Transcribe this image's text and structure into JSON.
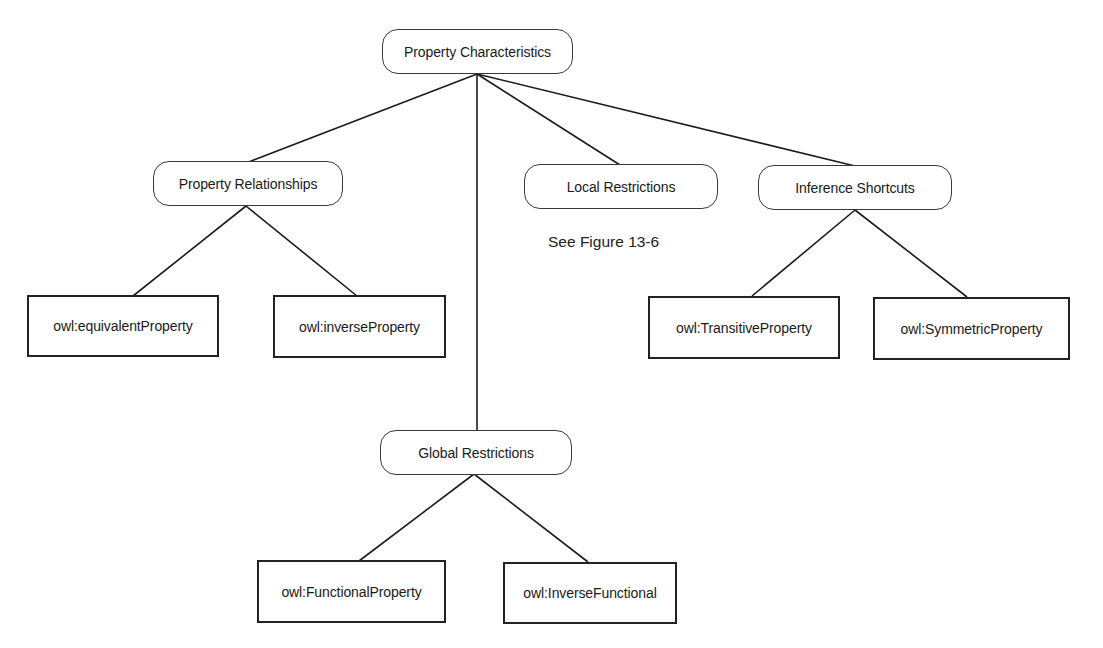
{
  "diagram": {
    "type": "tree",
    "root": {
      "id": "property-characteristics",
      "label": "Property Characteristics",
      "shape": "rounded"
    },
    "categories": [
      {
        "id": "property-relationships",
        "label": "Property Relationships",
        "shape": "rounded",
        "children": [
          {
            "id": "equivalent-property",
            "label": "owl:equivalentProperty",
            "shape": "rect"
          },
          {
            "id": "inverse-property",
            "label": "owl:inverseProperty",
            "shape": "rect"
          }
        ]
      },
      {
        "id": "global-restrictions",
        "label": "Global Restrictions",
        "shape": "rounded",
        "children": [
          {
            "id": "functional-property",
            "label": "owl:FunctionalProperty",
            "shape": "rect"
          },
          {
            "id": "inverse-functional",
            "label": "owl:InverseFunctional",
            "shape": "rect"
          }
        ]
      },
      {
        "id": "local-restrictions",
        "label": "Local Restrictions",
        "shape": "rounded",
        "note": "See Figure 13-6",
        "children": []
      },
      {
        "id": "inference-shortcuts",
        "label": "Inference Shortcuts",
        "shape": "rounded",
        "children": [
          {
            "id": "transitive-property",
            "label": "owl:TransitiveProperty",
            "shape": "rect"
          },
          {
            "id": "symmetric-property",
            "label": "owl:SymmetricProperty",
            "shape": "rect"
          }
        ]
      }
    ],
    "edges": [
      [
        "property-characteristics",
        "property-relationships"
      ],
      [
        "property-characteristics",
        "global-restrictions"
      ],
      [
        "property-characteristics",
        "local-restrictions"
      ],
      [
        "property-characteristics",
        "inference-shortcuts"
      ],
      [
        "property-relationships",
        "equivalent-property"
      ],
      [
        "property-relationships",
        "inverse-property"
      ],
      [
        "global-restrictions",
        "functional-property"
      ],
      [
        "global-restrictions",
        "inverse-functional"
      ],
      [
        "inference-shortcuts",
        "transitive-property"
      ],
      [
        "inference-shortcuts",
        "symmetric-property"
      ]
    ],
    "caption": ""
  }
}
